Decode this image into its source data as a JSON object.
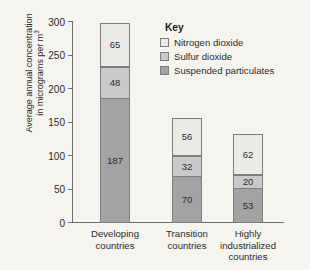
{
  "chart_data": {
    "type": "bar",
    "subtype": "stacked-bar",
    "title": "",
    "xlabel": "",
    "ylabel": "Average annual concentration in micrograms per m3",
    "ylabel_lines": [
      "Average annual concentration",
      "in micrograms per m"
    ],
    "ylabel_superscript": "3",
    "ylim": [
      0,
      300
    ],
    "yticks": [
      0,
      50,
      100,
      150,
      200,
      250,
      300
    ],
    "ytick_labels": [
      "0",
      "50",
      "100",
      "150",
      "200",
      "250",
      "300"
    ],
    "grid": false,
    "legend_position": "top-right",
    "legend_title": "Key",
    "categories": [
      "Developing countries",
      "Transition countries",
      "Highly industrialized countries"
    ],
    "category_label_lines": [
      [
        "Developing",
        "countries"
      ],
      [
        "Transition",
        "countries"
      ],
      [
        "Highly",
        "industrialized",
        "countries"
      ]
    ],
    "series": [
      {
        "name": "Suspended particulates",
        "color": "#a3a3a3",
        "values": [
          187,
          70,
          53
        ]
      },
      {
        "name": "Sulfur dioxide",
        "color": "#c9c9c9",
        "values": [
          48,
          32,
          20
        ]
      },
      {
        "name": "Nitrogen dioxide",
        "color": "#eaeae6",
        "values": [
          65,
          56,
          62
        ]
      }
    ],
    "stack_order_bottom_to_top": [
      "Suspended particulates",
      "Sulfur dioxide",
      "Nitrogen dioxide"
    ],
    "totals": [
      300,
      158,
      135
    ],
    "colors": {
      "nitrogen_dioxide": "#eaeae6",
      "sulfur_dioxide": "#c9c9c9",
      "suspended_particulates": "#a3a3a3",
      "axis": "#6e6e6e",
      "segment_border": "#7d7d7d",
      "background": "#f6f4ef",
      "text": "#2b2b2b"
    }
  }
}
